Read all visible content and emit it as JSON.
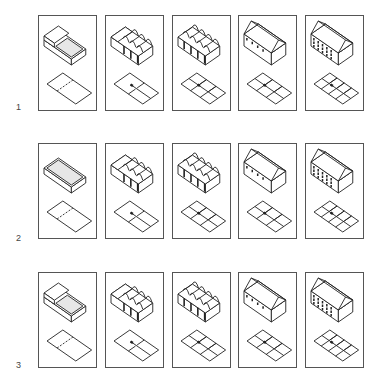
{
  "figure": {
    "rows": [
      {
        "label": "1",
        "top": 15,
        "cells": [
          {
            "stage": 1,
            "mass": "open-box-half",
            "bays": 0,
            "plan_rooms": 2,
            "plan_split": "dashed"
          },
          {
            "stage": 2,
            "mass": "vaulted-bays",
            "bays": 3,
            "plan_rooms": 4,
            "plan_split": "partial"
          },
          {
            "stage": 3,
            "mass": "vaulted-bays-full",
            "bays": 4,
            "plan_rooms": 6,
            "plan_split": "grid"
          },
          {
            "stage": 4,
            "mass": "gabled-arcade",
            "bays": 4,
            "plan_rooms": 6,
            "plan_split": "grid"
          },
          {
            "stage": 5,
            "mass": "gabled-multistorey",
            "bays": 5,
            "plan_rooms": 8,
            "plan_split": "grid"
          }
        ]
      },
      {
        "label": "2",
        "top": 143,
        "cells": [
          {
            "stage": 1,
            "mass": "open-box",
            "bays": 0,
            "plan_rooms": 2,
            "plan_split": "dashed"
          },
          {
            "stage": 2,
            "mass": "vaulted-bays",
            "bays": 3,
            "plan_rooms": 4,
            "plan_split": "partial"
          },
          {
            "stage": 3,
            "mass": "vaulted-bays-full",
            "bays": 4,
            "plan_rooms": 6,
            "plan_split": "grid"
          },
          {
            "stage": 4,
            "mass": "gabled-arcade",
            "bays": 4,
            "plan_rooms": 6,
            "plan_split": "grid"
          },
          {
            "stage": 5,
            "mass": "gabled-multistorey",
            "bays": 5,
            "plan_rooms": 8,
            "plan_split": "grid"
          }
        ]
      },
      {
        "label": "3",
        "top": 272,
        "cells": [
          {
            "stage": 1,
            "mass": "open-box-half",
            "bays": 0,
            "plan_rooms": 2,
            "plan_split": "dashed"
          },
          {
            "stage": 2,
            "mass": "vaulted-bays",
            "bays": 3,
            "plan_rooms": 4,
            "plan_split": "partial"
          },
          {
            "stage": 3,
            "mass": "vaulted-bays-full",
            "bays": 4,
            "plan_rooms": 6,
            "plan_split": "grid"
          },
          {
            "stage": 4,
            "mass": "gabled-arcade",
            "bays": 4,
            "plan_rooms": 6,
            "plan_split": "grid"
          },
          {
            "stage": 5,
            "mass": "gabled-multistorey",
            "bays": 5,
            "plan_rooms": 8,
            "plan_split": "grid"
          }
        ]
      }
    ],
    "column_x": [
      38,
      105,
      172,
      238,
      305
    ],
    "label_offsets": [
      93,
      96,
      94
    ],
    "colors": {
      "line": "#222222",
      "frame": "#555555",
      "stipple": "#bbbbbb",
      "fill": "#ffffff"
    }
  }
}
